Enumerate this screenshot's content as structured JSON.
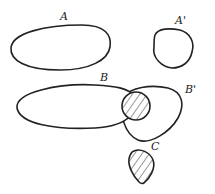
{
  "diagram": {
    "type": "hatched-regions",
    "colors": {
      "stroke": "#222222",
      "hatch": "#333333",
      "background": "#ffffff"
    },
    "regions": [
      {
        "id": "A",
        "label": "A",
        "fill": "diagonal-hatch"
      },
      {
        "id": "A_prime",
        "label": "A'",
        "fill": "diagonal-hatch"
      },
      {
        "id": "B",
        "label": "B",
        "fill": "diagonal-hatch"
      },
      {
        "id": "B_prime",
        "label": "B'",
        "fill": "diagonal-hatch"
      },
      {
        "id": "B_overlap",
        "label": "",
        "fill": "cross-hatch"
      },
      {
        "id": "C",
        "label": "C",
        "fill": "cross-hatch"
      }
    ]
  }
}
